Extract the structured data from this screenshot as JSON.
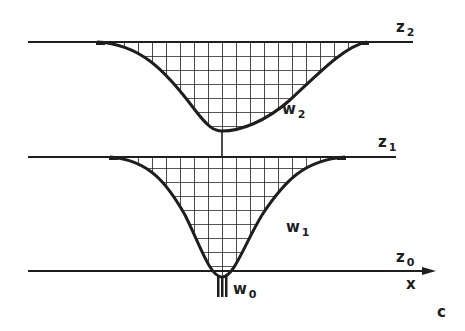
{
  "figure": {
    "panel_letter": "c",
    "colors": {
      "ink": "#1e1e1e",
      "background": "#ffffff"
    },
    "levels": [
      {
        "id": "z2",
        "label": "z",
        "subscript": "2"
      },
      {
        "id": "z1",
        "label": "z",
        "subscript": "1"
      },
      {
        "id": "z0",
        "label": "z",
        "subscript": "0"
      }
    ],
    "profiles": [
      {
        "id": "W2",
        "label": "w",
        "subscript": "2",
        "fill": "grid-hatch"
      },
      {
        "id": "W1",
        "label": "w",
        "subscript": "1",
        "fill": "grid-hatch"
      },
      {
        "id": "W0",
        "label": "w",
        "subscript": "0",
        "fill": "source-stem"
      }
    ],
    "axis": {
      "label": "x",
      "direction": "right-arrow"
    }
  }
}
